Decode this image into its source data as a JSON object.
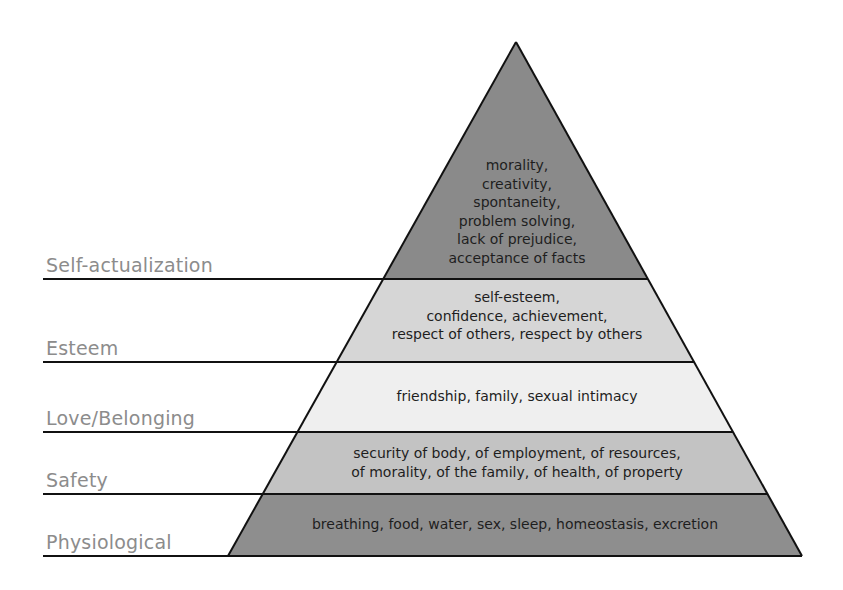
{
  "diagram": {
    "type": "pyramid",
    "colors": {
      "self_actualization": "#8a8a8a",
      "esteem": "#d6d6d6",
      "love_belonging": "#efefef",
      "safety": "#c3c3c3",
      "physiological": "#8e8e8e",
      "outline": "#111111",
      "label": "#8c8c8c"
    },
    "levels": [
      {
        "name": "Self-actualization",
        "lines": [
          "morality,",
          "creativity,",
          "spontaneity,",
          "problem solving,",
          "lack of prejudice,",
          "acceptance of facts"
        ]
      },
      {
        "name": "Esteem",
        "lines": [
          "self-esteem,",
          "confidence, achievement,",
          "respect of others, respect by others"
        ]
      },
      {
        "name": "Love/Belonging",
        "lines": [
          "friendship, family, sexual intimacy"
        ]
      },
      {
        "name": "Safety",
        "lines": [
          "security of body, of employment, of resources,",
          "of morality, of the family, of health, of property"
        ]
      },
      {
        "name": "Physiological",
        "lines": [
          "breathing, food, water, sex, sleep, homeostasis, excretion"
        ]
      }
    ]
  }
}
